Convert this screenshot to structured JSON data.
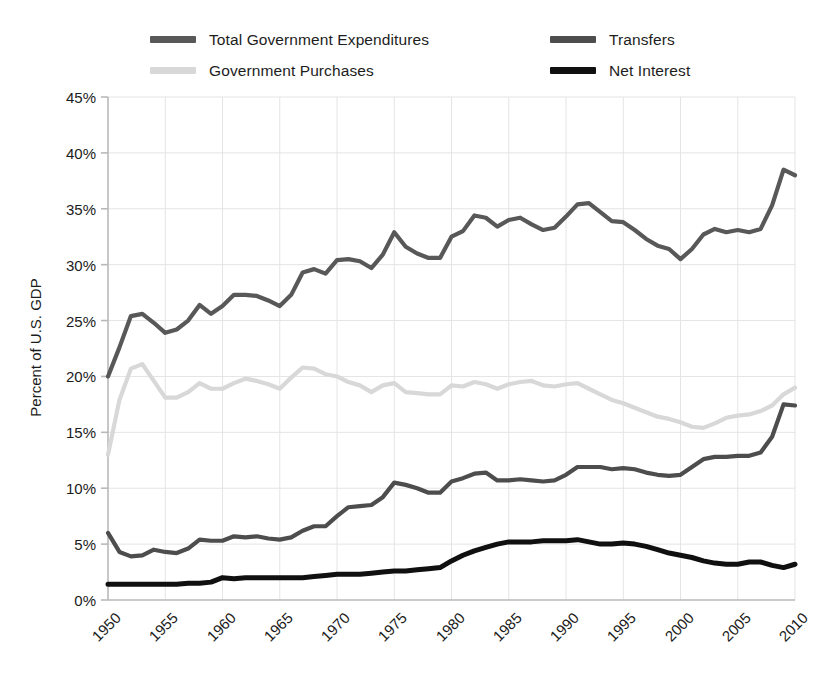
{
  "chart_data": {
    "type": "line",
    "title": "",
    "xlabel": "",
    "ylabel": "Percent of U.S. GDP",
    "xlim": [
      1950,
      2010
    ],
    "ylim": [
      0,
      45
    ],
    "ytick_values": [
      0,
      5,
      10,
      15,
      20,
      25,
      30,
      35,
      40,
      45
    ],
    "ytick_labels": [
      "0%",
      "5%",
      "10%",
      "15%",
      "20%",
      "25%",
      "30%",
      "35%",
      "40%",
      "45%"
    ],
    "xtick_values": [
      1950,
      1955,
      1960,
      1965,
      1970,
      1975,
      1980,
      1985,
      1990,
      1995,
      2000,
      2005,
      2010
    ],
    "xtick_labels": [
      "1950",
      "1955",
      "1960",
      "1965",
      "1970",
      "1975",
      "1980",
      "1985",
      "1990",
      "1995",
      "2000",
      "2005",
      "2010"
    ],
    "grid": "horizontal-and-vertical",
    "legend_position": "top",
    "x": [
      1950,
      1951,
      1952,
      1953,
      1954,
      1955,
      1956,
      1957,
      1958,
      1959,
      1960,
      1961,
      1962,
      1963,
      1964,
      1965,
      1966,
      1967,
      1968,
      1969,
      1970,
      1971,
      1972,
      1973,
      1974,
      1975,
      1976,
      1977,
      1978,
      1979,
      1980,
      1981,
      1982,
      1983,
      1984,
      1985,
      1986,
      1987,
      1988,
      1989,
      1990,
      1991,
      1992,
      1993,
      1994,
      1995,
      1996,
      1997,
      1998,
      1999,
      2000,
      2001,
      2002,
      2003,
      2004,
      2005,
      2006,
      2007,
      2008,
      2009,
      2010
    ],
    "series": [
      {
        "name": "Total Government Expenditures",
        "color": "#585858",
        "width": 4.2,
        "values": [
          20.0,
          22.6,
          25.4,
          25.6,
          24.8,
          23.9,
          24.2,
          25.0,
          26.4,
          25.6,
          26.3,
          27.3,
          27.3,
          27.2,
          26.8,
          26.3,
          27.3,
          29.3,
          29.6,
          29.2,
          30.4,
          30.5,
          30.3,
          29.7,
          30.9,
          32.9,
          31.6,
          31.0,
          30.6,
          30.6,
          32.5,
          33.0,
          34.4,
          34.2,
          33.4,
          34.0,
          34.2,
          33.6,
          33.1,
          33.3,
          34.3,
          35.4,
          35.5,
          34.7,
          33.9,
          33.8,
          33.1,
          32.3,
          31.7,
          31.4,
          30.5,
          31.4,
          32.7,
          33.2,
          32.9,
          33.1,
          32.9,
          33.2,
          35.3,
          38.5,
          38.0
        ]
      },
      {
        "name": "Government Purchases",
        "color": "#d8d8d8",
        "width": 4.2,
        "values": [
          13.0,
          17.9,
          20.7,
          21.1,
          19.6,
          18.1,
          18.1,
          18.6,
          19.4,
          18.9,
          18.9,
          19.4,
          19.8,
          19.6,
          19.3,
          18.9,
          19.9,
          20.8,
          20.7,
          20.2,
          20.0,
          19.5,
          19.2,
          18.6,
          19.2,
          19.4,
          18.6,
          18.5,
          18.4,
          18.4,
          19.2,
          19.1,
          19.5,
          19.3,
          18.9,
          19.3,
          19.5,
          19.6,
          19.2,
          19.1,
          19.3,
          19.4,
          18.9,
          18.4,
          17.9,
          17.6,
          17.2,
          16.8,
          16.4,
          16.2,
          15.9,
          15.5,
          15.4,
          15.8,
          16.3,
          16.5,
          16.6,
          16.9,
          17.4,
          18.4,
          19.0
        ]
      },
      {
        "name": "Transfers",
        "color": "#4d4d4d",
        "width": 4.2,
        "values": [
          6.0,
          4.3,
          3.9,
          4.0,
          4.5,
          4.3,
          4.2,
          4.6,
          5.4,
          5.3,
          5.3,
          5.7,
          5.6,
          5.7,
          5.5,
          5.4,
          5.6,
          6.2,
          6.6,
          6.6,
          7.5,
          8.3,
          8.4,
          8.5,
          9.2,
          10.5,
          10.3,
          10.0,
          9.6,
          9.6,
          10.6,
          10.9,
          11.3,
          11.4,
          10.7,
          10.7,
          10.8,
          10.7,
          10.6,
          10.7,
          11.2,
          11.9,
          11.9,
          11.9,
          11.7,
          11.8,
          11.7,
          11.4,
          11.2,
          11.1,
          11.2,
          11.9,
          12.6,
          12.8,
          12.8,
          12.9,
          12.9,
          13.2,
          14.6,
          17.5,
          17.4
        ]
      },
      {
        "name": "Net Interest",
        "color": "#101010",
        "width": 5.0,
        "values": [
          1.4,
          1.4,
          1.4,
          1.4,
          1.4,
          1.4,
          1.4,
          1.5,
          1.5,
          1.6,
          2.0,
          1.9,
          2.0,
          2.0,
          2.0,
          2.0,
          2.0,
          2.0,
          2.1,
          2.2,
          2.3,
          2.3,
          2.3,
          2.4,
          2.5,
          2.6,
          2.6,
          2.7,
          2.8,
          2.9,
          3.5,
          4.0,
          4.4,
          4.7,
          5.0,
          5.2,
          5.2,
          5.2,
          5.3,
          5.3,
          5.3,
          5.4,
          5.2,
          5.0,
          5.0,
          5.1,
          5.0,
          4.8,
          4.5,
          4.2,
          4.0,
          3.8,
          3.5,
          3.3,
          3.2,
          3.2,
          3.4,
          3.4,
          3.1,
          2.9,
          3.2
        ]
      }
    ]
  },
  "legend": {
    "columns": [
      {
        "items": [
          {
            "label": "Total Government Expenditures",
            "color": "#585858",
            "name": "legend-total-government-expenditures"
          },
          {
            "label": "Government Purchases",
            "color": "#d8d8d8",
            "name": "legend-government-purchases"
          }
        ]
      },
      {
        "items": [
          {
            "label": "Transfers",
            "color": "#4d4d4d",
            "name": "legend-transfers"
          },
          {
            "label": "Net Interest",
            "color": "#101010",
            "name": "legend-net-interest"
          }
        ]
      }
    ]
  },
  "axes": {
    "y_title": "Percent of U.S. GDP",
    "axis_color": "#b9b9b9",
    "grid_color": "#e4e4e4"
  }
}
